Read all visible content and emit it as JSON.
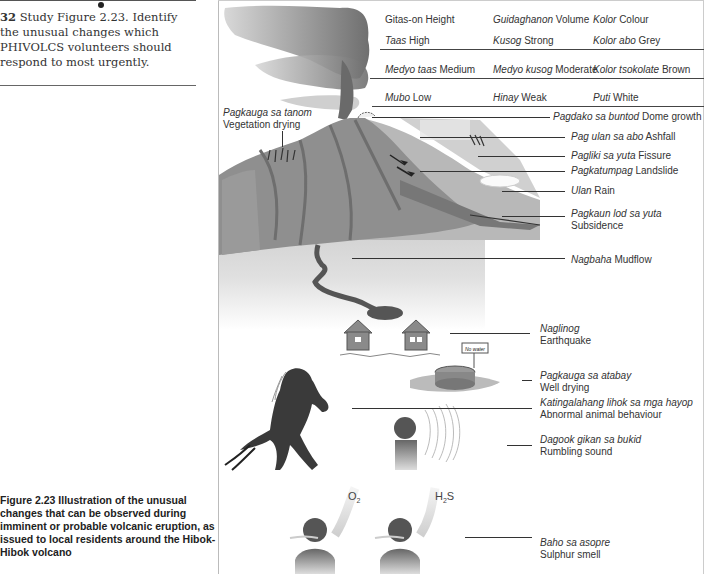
{
  "question": {
    "number": "32",
    "text": "Study Figure 2.23. Identify the unusual changes which PHIVOLCS volunteers should respond to most urgently."
  },
  "caption": {
    "text": "Figure 2.23  Illustration of the unusual changes that can be observed during imminent or probable volcanic eruption, as issued to local residents around the Hibok-Hibok volcano"
  },
  "legend": {
    "headers": [
      {
        "local": "Gitas-on",
        "english": "Height"
      },
      {
        "local": "Guidaghanon",
        "english": "Volume"
      },
      {
        "local": "Kolor",
        "english": "Colour"
      }
    ],
    "rows": [
      [
        {
          "local": "Taas",
          "english": "High"
        },
        {
          "local": "Kusog",
          "english": "Strong"
        },
        {
          "local": "Kolor abo",
          "english": "Grey"
        }
      ],
      [
        {
          "local": "Medyo taas",
          "english": "Medium"
        },
        {
          "local": "Medyo kusog",
          "english": "Moderate"
        },
        {
          "local": "Kolor tsokolate",
          "english": "Brown"
        }
      ],
      [
        {
          "local": "Mubo",
          "english": "Low"
        },
        {
          "local": "Hinay",
          "english": "Weak"
        },
        {
          "local": "Puti",
          "english": "White"
        }
      ]
    ]
  },
  "labels": {
    "vegetation": {
      "local": "Pagkauga sa tanom",
      "english": "Vegetation drying"
    },
    "dome": {
      "local": "Pagdako sa buntod",
      "english": "Dome growth"
    },
    "ashfall": {
      "local": "Pag ulan sa abo",
      "english": "Ashfall"
    },
    "fissure": {
      "local": "Pagliki sa yuta",
      "english": "Fissure"
    },
    "landslide": {
      "local": "Pagkatumpag",
      "english": "Landslide"
    },
    "rain": {
      "local": "Ulan",
      "english": "Rain"
    },
    "subsidence": {
      "local": "Pagkaun lod sa yuta",
      "english": "Subsidence"
    },
    "mudflow": {
      "local": "Nagbaha",
      "english": "Mudflow"
    },
    "earthquake": {
      "local": "Naglinog",
      "english": "Earthquake"
    },
    "well": {
      "local": "Pagkauga sa atabay",
      "english": "Well drying"
    },
    "animal": {
      "local": "Katingalahang lihok sa mga hayop",
      "english": "Abnormal animal behaviour"
    },
    "rumbling": {
      "local": "Dagook gikan sa bukid",
      "english": "Rumbling sound"
    },
    "sulphur": {
      "local": "Baho sa asopre",
      "english": "Sulphur smell"
    }
  },
  "gases": {
    "left": {
      "base": "O",
      "sub": "2",
      "tail": ""
    },
    "right": {
      "base": "H",
      "sub": "2",
      "tail": "S"
    }
  },
  "well_sign": "No water"
}
